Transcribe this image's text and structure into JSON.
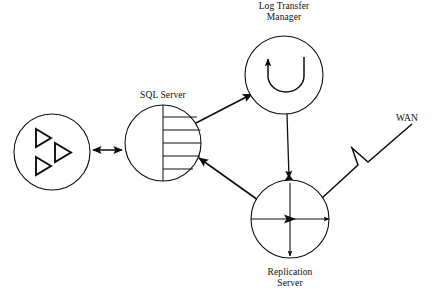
{
  "diagram": {
    "type": "network-topology-diagram",
    "background_color": "#ffffff",
    "line_color": "#0d0d0d",
    "nodes": [
      {
        "id": "client-cluster",
        "label": "",
        "shape": "circle",
        "glyph": "three-triangles",
        "cx": 52,
        "cy": 152,
        "r": 38
      },
      {
        "id": "sql-server",
        "label": "SQL Server",
        "shape": "circle",
        "glyph": "database-lines",
        "cx": 163,
        "cy": 143,
        "r": 38,
        "line_count": 5
      },
      {
        "id": "log-transfer-manager",
        "label": "Log Transfer\nManager",
        "shape": "circle",
        "glyph": "u-turn-arrow",
        "cx": 284,
        "cy": 75,
        "r": 39
      },
      {
        "id": "replication-server",
        "label": "Replication\nServer",
        "shape": "circle",
        "glyph": "cross-arrows",
        "cx": 290,
        "cy": 219,
        "r": 39
      },
      {
        "id": "wan",
        "label": "WAN",
        "shape": "lightning-bolt",
        "cx": 380,
        "cy": 155
      }
    ],
    "edges": [
      {
        "id": "client-to-sql",
        "from": "client-cluster",
        "to": "sql-server",
        "style": "double-arrow"
      },
      {
        "id": "sql-to-ltm",
        "from": "sql-server",
        "to": "log-transfer-manager",
        "style": "single-arrow"
      },
      {
        "id": "ltm-to-replication",
        "from": "log-transfer-manager",
        "to": "replication-server",
        "style": "single-arrow"
      },
      {
        "id": "replication-to-sql",
        "from": "replication-server",
        "to": "sql-server",
        "style": "single-arrow"
      },
      {
        "id": "replication-to-wan",
        "from": "replication-server",
        "to": "wan",
        "style": "lightning"
      }
    ]
  },
  "labels": {
    "sql_server": "SQL Server",
    "log_transfer_manager_line1": "Log Transfer",
    "log_transfer_manager_line2": "Manager",
    "replication_server_line1": "Replication",
    "replication_server_line2": "Server",
    "wan": "WAN"
  }
}
